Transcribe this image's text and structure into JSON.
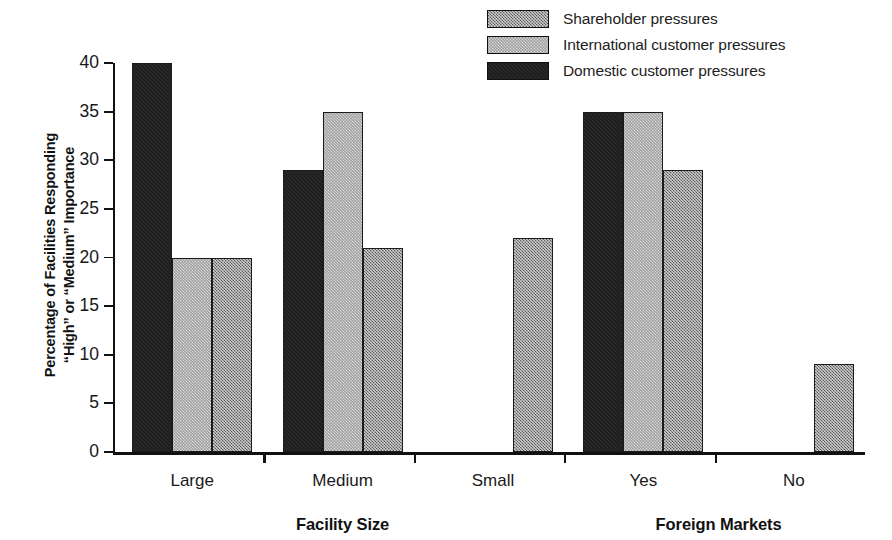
{
  "chart_data": {
    "type": "bar",
    "title": "",
    "ylabel": "Percentage of Facilities Responding “High” or “Medium” Importance",
    "ylabel_lines": [
      "Percentage of Facilities Responding",
      "“High” or “Medium” Importance"
    ],
    "xlabel": "",
    "ylim": [
      0,
      40
    ],
    "ytick_labels": [
      "0",
      "5",
      "10",
      "15",
      "20",
      "25",
      "30",
      "35",
      "40"
    ],
    "ytick_values": [
      0,
      5,
      10,
      15,
      20,
      25,
      30,
      35,
      40
    ],
    "grid": false,
    "legend_position": "top-right",
    "categories": [
      "Large",
      "Medium",
      "Small",
      "Yes",
      "No"
    ],
    "group_sections": [
      {
        "label": "Facility Size",
        "categories": [
          "Large",
          "Medium",
          "Small"
        ]
      },
      {
        "label": "Foreign Markets",
        "categories": [
          "Yes",
          "No"
        ]
      }
    ],
    "bar_order": [
      "Domestic customer pressures",
      "International customer pressures",
      "Shareholder pressures"
    ],
    "series": [
      {
        "name": "Shareholder pressures",
        "fill": "shareholder",
        "color": "#8b8b8b",
        "values": [
          20,
          21,
          22,
          29,
          9
        ]
      },
      {
        "name": "International customer pressures",
        "fill": "international",
        "color": "#e2e2e2",
        "values": [
          20,
          35,
          0,
          35,
          0
        ]
      },
      {
        "name": "Domestic customer pressures",
        "fill": "domestic",
        "color": "#201f1f",
        "values": [
          40,
          29,
          0,
          35,
          0
        ]
      }
    ]
  },
  "legend": {
    "items": [
      {
        "label": "Shareholder pressures",
        "fill": "shareholder"
      },
      {
        "label": "International customer pressures",
        "fill": "international"
      },
      {
        "label": "Domestic customer pressures",
        "fill": "domestic"
      }
    ]
  },
  "axis": {
    "y_title_line1": "Percentage of Facilities Responding",
    "y_title_line2": "“High” or “Medium” Importance"
  }
}
